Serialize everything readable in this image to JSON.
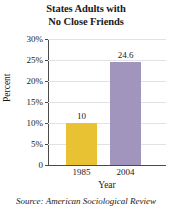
{
  "chart_data": {
    "type": "bar",
    "title": "States Adults with No Close Friends",
    "title_lines": [
      "States Adults with",
      "No Close Friends"
    ],
    "categories": [
      "1985",
      "2004"
    ],
    "values": [
      10,
      24.6
    ],
    "value_labels": [
      "10",
      "24.6"
    ],
    "series": [
      {
        "name": "Percent of adults with no close friends",
        "values": [
          10,
          24.6
        ]
      }
    ],
    "xlabel": "Year",
    "ylabel": "Percent",
    "ylim": [
      0,
      30
    ],
    "yticks": [
      0,
      5,
      10,
      15,
      20,
      25,
      30
    ],
    "ytick_labels": [
      "0",
      "5%",
      "10%",
      "15%",
      "20%",
      "25%",
      "30%"
    ],
    "grid": true,
    "legend": false,
    "bar_colors": [
      "#e9c233",
      "#a194bd"
    ],
    "source": "Source: American Sociological Review"
  },
  "colors": {
    "bar_1985": "#e9c233",
    "bar_2004": "#a194bd",
    "axis": "#4a4a4a",
    "gridline": "#e2e2e2",
    "text": "#1a1a1a",
    "background": "#ffffff"
  }
}
